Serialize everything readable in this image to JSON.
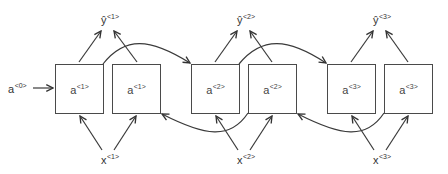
{
  "diagram": {
    "type": "bidirectional-rnn",
    "colors": {
      "box_border": "#4a4a4a",
      "arrow": "#333333",
      "text": "#333333"
    },
    "initial_activation": {
      "base": "a",
      "sup": "<0>"
    },
    "timesteps": [
      {
        "input": {
          "base": "x",
          "sup": "<1>"
        },
        "output": {
          "base": "ŷ",
          "sup": "<1>"
        },
        "forward_cell": {
          "base": "a",
          "sup": "<1>"
        },
        "backward_cell": {
          "base": "a",
          "sup": "<1>"
        }
      },
      {
        "input": {
          "base": "x",
          "sup": "<2>"
        },
        "output": {
          "base": "ŷ",
          "sup": "<2>"
        },
        "forward_cell": {
          "base": "a",
          "sup": "<2>"
        },
        "backward_cell": {
          "base": "a",
          "sup": "<2>"
        }
      },
      {
        "input": {
          "base": "x",
          "sup": "<3>"
        },
        "output": {
          "base": "ŷ",
          "sup": "<3>"
        },
        "forward_cell": {
          "base": "a",
          "sup": "<3>"
        },
        "backward_cell": {
          "base": "a",
          "sup": "<3>"
        }
      }
    ]
  }
}
